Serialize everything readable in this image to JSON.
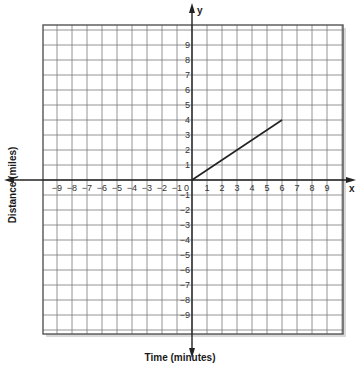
{
  "chart_data": {
    "type": "line",
    "title": "",
    "xlabel": "Time (minutes)",
    "ylabel": "Distance (miles)",
    "x_axis_letter": "x",
    "y_axis_letter": "y",
    "xlim": [
      -10,
      10
    ],
    "ylim": [
      -10,
      10
    ],
    "grid": true,
    "x_ticks": [
      -9,
      -8,
      -7,
      -6,
      -5,
      -4,
      -3,
      -2,
      -1,
      0,
      1,
      2,
      3,
      4,
      5,
      6,
      7,
      8,
      9
    ],
    "y_ticks": [
      -9,
      -8,
      -7,
      -6,
      -5,
      -4,
      -3,
      -2,
      -1,
      0,
      1,
      2,
      3,
      4,
      5,
      6,
      7,
      8,
      9
    ],
    "series": [
      {
        "name": "distance",
        "x": [
          0,
          6
        ],
        "y": [
          0,
          4
        ]
      }
    ],
    "colors": {
      "line": "#222222",
      "grid": "#7a7a7a",
      "axis": "#222222",
      "border": "#555555"
    }
  }
}
